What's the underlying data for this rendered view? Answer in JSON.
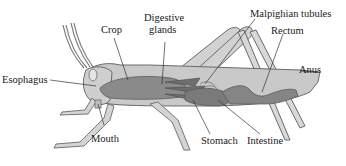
{
  "diagram": {
    "labels": {
      "crop": "Crop",
      "digestive_glands_1": "Digestive",
      "digestive_glands_2": "glands",
      "malpighian_tubules": "Malpighian tubules",
      "rectum": "Rectum",
      "esophagus": "Esophagus",
      "anus": "Anus",
      "mouth": "Mouth",
      "stomach": "Stomach",
      "intestine": "Intestine"
    },
    "colors": {
      "body": "#c9c9c9",
      "body_outline": "#6a6a6a",
      "gut": "#8a8a8a",
      "gut_dark": "#6e6e6e",
      "leader_line": "#333333",
      "text": "#1a1a1a"
    }
  }
}
